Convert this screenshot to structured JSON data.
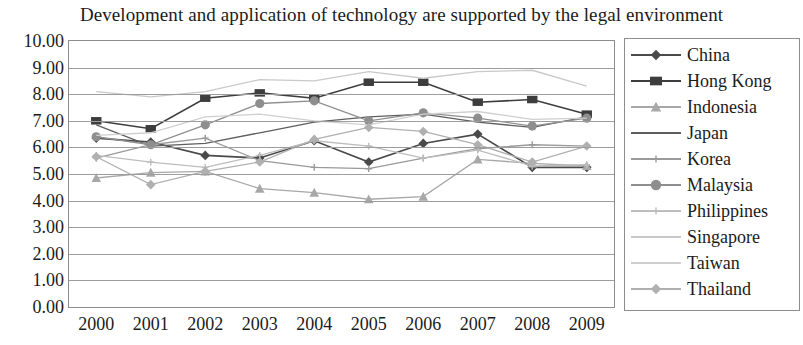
{
  "chart_data": {
    "type": "line",
    "title": "Development and application of technology are supported by the legal environment",
    "xlabel": "",
    "ylabel": "",
    "ylim": [
      0,
      10
    ],
    "ytick_step": 1,
    "ytick_format": "0.00",
    "yticks": [
      "10.00",
      "9.00",
      "8.00",
      "7.00",
      "6.00",
      "5.00",
      "4.00",
      "3.00",
      "2.00",
      "1.00",
      "0.00"
    ],
    "categories": [
      "2000",
      "2001",
      "2002",
      "2003",
      "2004",
      "2005",
      "2006",
      "2007",
      "2008",
      "2009"
    ],
    "x": [
      2000,
      2001,
      2002,
      2003,
      2004,
      2005,
      2006,
      2007,
      2008,
      2009
    ],
    "grid": "horizontal",
    "legend_position": "right",
    "series": [
      {
        "name": "China",
        "color": "#4a4a4a",
        "marker": "diamond",
        "values": [
          6.35,
          6.2,
          5.7,
          5.6,
          6.25,
          5.45,
          6.15,
          6.5,
          5.25,
          5.25
        ]
      },
      {
        "name": "Hong Kong",
        "color": "#3d3d3d",
        "marker": "square",
        "values": [
          7.0,
          6.7,
          7.85,
          8.05,
          7.85,
          8.45,
          8.45,
          7.7,
          7.8,
          7.25
        ]
      },
      {
        "name": "Indonesia",
        "color": "#a8a8a8",
        "marker": "triangle",
        "values": [
          4.85,
          5.05,
          5.1,
          4.45,
          4.3,
          4.05,
          4.15,
          5.55,
          5.4,
          5.3
        ]
      },
      {
        "name": "Japan",
        "color": "#5e5e5e",
        "marker": "none",
        "values": [
          6.85,
          6.05,
          6.15,
          6.55,
          6.95,
          7.15,
          7.25,
          6.95,
          6.75,
          7.15
        ]
      },
      {
        "name": "Korea",
        "color": "#9a9a9a",
        "marker": "plus",
        "values": [
          5.6,
          6.1,
          6.35,
          5.5,
          5.25,
          5.2,
          5.6,
          5.95,
          6.1,
          6.05
        ]
      },
      {
        "name": "Malaysia",
        "color": "#8e8e8e",
        "marker": "circle",
        "values": [
          6.4,
          6.1,
          6.85,
          7.65,
          7.75,
          7.0,
          7.3,
          7.1,
          6.8,
          7.1
        ]
      },
      {
        "name": "Philippines",
        "color": "#bdbdbd",
        "marker": "plus",
        "values": [
          5.7,
          5.45,
          5.25,
          5.7,
          6.25,
          6.05,
          5.6,
          5.9,
          5.3,
          5.35
        ]
      },
      {
        "name": "Singapore",
        "color": "#c9c9c9",
        "marker": "none",
        "values": [
          8.1,
          7.9,
          8.1,
          8.55,
          8.5,
          8.85,
          8.6,
          8.85,
          8.9,
          8.3
        ]
      },
      {
        "name": "Taiwan",
        "color": "#cfcfcf",
        "marker": "none",
        "values": [
          6.45,
          6.55,
          7.15,
          7.25,
          7.0,
          6.85,
          7.25,
          7.35,
          7.05,
          7.1
        ]
      },
      {
        "name": "Thailand",
        "color": "#b0b0b0",
        "marker": "diamond",
        "values": [
          5.65,
          4.6,
          5.1,
          5.45,
          6.3,
          6.75,
          6.6,
          6.1,
          5.45,
          6.05
        ]
      }
    ]
  }
}
